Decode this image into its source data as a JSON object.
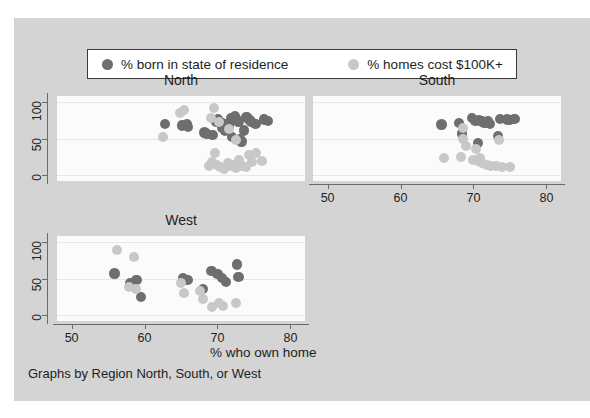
{
  "legend": {
    "entries": [
      {
        "label": "% born in state of residence",
        "color": "#6e6e6e",
        "icon": "circle-marker-dark"
      },
      {
        "label": "% homes cost $100K+",
        "color": "#c8c8c8",
        "icon": "circle-marker-light"
      }
    ]
  },
  "axis_title_x": "% who own home",
  "caption": "Graphs by Region North, South, or West",
  "panels": [
    {
      "title": "North"
    },
    {
      "title": "South"
    },
    {
      "title": "West"
    }
  ],
  "chart_data": {
    "type": "scatter",
    "title": "",
    "xlabel": "% who own home",
    "ylabel": "",
    "xlim": [
      48,
      82
    ],
    "ylim": [
      -8,
      108
    ],
    "xticks": [
      50,
      60,
      70,
      80
    ],
    "yticks": [
      0,
      50,
      100
    ],
    "grid": true,
    "legend_position": "top",
    "caption": "Graphs by Region North, South, or West",
    "facets": [
      {
        "name": "North",
        "series": [
          {
            "name": "% born in state of residence",
            "color": "#6e6e6e",
            "points": [
              [
                62.8,
                70
              ],
              [
                65.1,
                68
              ],
              [
                65.8,
                69
              ],
              [
                66.0,
                66
              ],
              [
                68.2,
                58
              ],
              [
                68.5,
                56
              ],
              [
                69.3,
                55
              ],
              [
                69.8,
                73
              ],
              [
                70.1,
                76
              ],
              [
                70.4,
                72
              ],
              [
                70.8,
                70
              ],
              [
                71.2,
                69
              ],
              [
                71.5,
                67
              ],
              [
                71.9,
                78
              ],
              [
                72.2,
                76
              ],
              [
                72.4,
                80
              ],
              [
                72.7,
                75
              ],
              [
                72.9,
                73
              ],
              [
                73.1,
                49
              ],
              [
                73.3,
                46
              ],
              [
                73.6,
                61
              ],
              [
                74.0,
                79
              ],
              [
                74.3,
                76
              ],
              [
                74.6,
                73
              ],
              [
                75.2,
                70
              ],
              [
                76.4,
                76
              ],
              [
                76.9,
                74
              ],
              [
                70.6,
                64
              ],
              [
                71.0,
                60
              ],
              [
                72.0,
                52
              ]
            ]
          },
          {
            "name": "% homes cost $100K+",
            "color": "#c8c8c8",
            "points": [
              [
                64.9,
                85
              ],
              [
                65.4,
                89
              ],
              [
                62.6,
                52
              ],
              [
                69.5,
                91
              ],
              [
                69.1,
                78
              ],
              [
                70.2,
                72
              ],
              [
                71.6,
                63
              ],
              [
                72.6,
                48
              ],
              [
                69.6,
                30
              ],
              [
                70.0,
                14
              ],
              [
                70.4,
                11
              ],
              [
                70.9,
                9
              ],
              [
                71.4,
                16
              ],
              [
                71.8,
                12
              ],
              [
                72.2,
                14
              ],
              [
                72.6,
                10
              ],
              [
                73.0,
                17
              ],
              [
                73.4,
                13
              ],
              [
                73.9,
                11
              ],
              [
                74.3,
                28
              ],
              [
                74.8,
                18
              ],
              [
                75.3,
                30
              ],
              [
                76.1,
                19
              ],
              [
                68.9,
                12
              ],
              [
                69.3,
                18
              ],
              [
                72.9,
                21
              ]
            ]
          }
        ]
      },
      {
        "name": "South",
        "series": [
          {
            "name": "% born in state of residence",
            "color": "#6e6e6e",
            "points": [
              [
                65.6,
                69
              ],
              [
                68.0,
                71
              ],
              [
                69.8,
                78
              ],
              [
                70.3,
                74
              ],
              [
                70.8,
                75
              ],
              [
                71.2,
                73
              ],
              [
                71.5,
                72
              ],
              [
                71.8,
                71
              ],
              [
                72.0,
                74
              ],
              [
                72.3,
                70
              ],
              [
                73.6,
                77
              ],
              [
                74.6,
                76
              ],
              [
                75.6,
                77
              ],
              [
                68.4,
                57
              ],
              [
                73.4,
                53
              ],
              [
                70.6,
                44
              ],
              [
                75.0,
                75
              ]
            ]
          },
          {
            "name": "% homes cost $100K+",
            "color": "#c8c8c8",
            "points": [
              [
                68.5,
                64
              ],
              [
                68.6,
                50
              ],
              [
                73.5,
                48
              ],
              [
                69.0,
                40
              ],
              [
                70.4,
                35
              ],
              [
                66.0,
                24
              ],
              [
                68.3,
                25
              ],
              [
                70.0,
                21
              ],
              [
                70.6,
                19
              ],
              [
                71.2,
                17
              ],
              [
                71.8,
                14
              ],
              [
                72.4,
                12
              ],
              [
                73.1,
                13
              ],
              [
                73.9,
                11
              ],
              [
                75.0,
                11
              ],
              [
                70.9,
                24
              ]
            ]
          }
        ]
      },
      {
        "name": "West",
        "series": [
          {
            "name": "% born in state of residence",
            "color": "#6e6e6e",
            "points": [
              [
                55.9,
                57
              ],
              [
                58.1,
                44
              ],
              [
                58.9,
                48
              ],
              [
                59.5,
                25
              ],
              [
                65.3,
                50
              ],
              [
                65.9,
                48
              ],
              [
                68.0,
                36
              ],
              [
                69.2,
                60
              ],
              [
                70.0,
                56
              ],
              [
                70.6,
                51
              ],
              [
                71.2,
                45
              ],
              [
                72.7,
                69
              ],
              [
                72.9,
                52
              ]
            ]
          },
          {
            "name": "% homes cost $100K+",
            "color": "#c8c8c8",
            "points": [
              [
                56.2,
                89
              ],
              [
                58.6,
                80
              ],
              [
                57.9,
                39
              ],
              [
                58.8,
                35
              ],
              [
                65.0,
                44
              ],
              [
                65.4,
                30
              ],
              [
                67.6,
                33
              ],
              [
                68.0,
                22
              ],
              [
                69.3,
                11
              ],
              [
                70.2,
                17
              ],
              [
                70.8,
                13
              ],
              [
                72.5,
                17
              ]
            ]
          }
        ]
      }
    ]
  }
}
